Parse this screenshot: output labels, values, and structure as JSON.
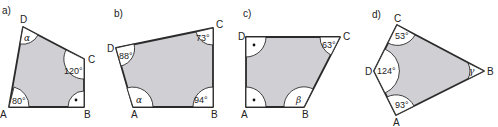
{
  "panels": [
    {
      "label": "a)",
      "vertices": {
        "A": "A",
        "B": "B",
        "C": "C",
        "D": "D"
      },
      "angles": {
        "A": "80°",
        "B": "right-angle",
        "C": "120°",
        "D": "α"
      }
    },
    {
      "label": "b)",
      "vertices": {
        "A": "A",
        "B": "B",
        "C": "C",
        "D": "D"
      },
      "angles": {
        "A": "α",
        "B": "94°",
        "C": "73°",
        "D": "88°"
      }
    },
    {
      "label": "c)",
      "vertices": {
        "A": "A",
        "B": "B",
        "C": "C",
        "D": "D"
      },
      "angles": {
        "A": "right-angle",
        "B": "β",
        "C": "63°",
        "D": "right-angle"
      }
    },
    {
      "label": "d)",
      "vertices": {
        "A": "A",
        "B": "B",
        "C": "C",
        "D": "D"
      },
      "angles": {
        "A": "93°",
        "B": "γ",
        "C": "53°",
        "D": "124°"
      }
    }
  ],
  "colors": {
    "fill": "#cfcfd4",
    "stroke": "#2a2a2a",
    "arc_fill": "#ffffff"
  }
}
